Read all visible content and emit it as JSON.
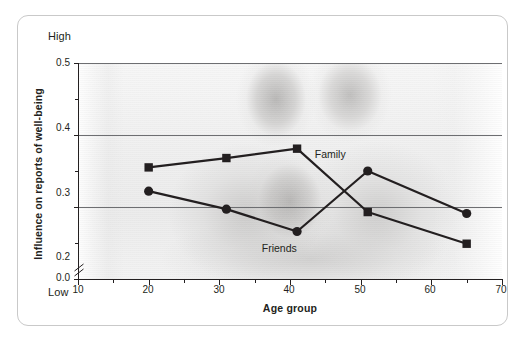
{
  "chart_data": {
    "type": "line",
    "title": "",
    "xlabel": "Age group",
    "ylabel": "Influence on reports of well-being",
    "xlim": [
      10,
      70
    ],
    "ylim": [
      0.2,
      0.5
    ],
    "y_axis_break": true,
    "y_break_labels": [
      "0.0",
      "0.2"
    ],
    "xticks": [
      10,
      20,
      30,
      40,
      50,
      60,
      70
    ],
    "xtick_labels": [
      "10",
      "20",
      "30",
      "40",
      "50",
      "60",
      "70"
    ],
    "yticks": [
      0.2,
      0.3,
      0.4,
      0.5
    ],
    "ytick_labels": [
      "0.2",
      "0.3",
      "0.4",
      "0.5"
    ],
    "y_minor_ticks": [
      0.25,
      0.35,
      0.45
    ],
    "grid": "horizontal",
    "axis_high_label": "High",
    "axis_low_label": "Low",
    "legend_position": "inline-annotations",
    "series": [
      {
        "name": "Family",
        "marker": "square",
        "color": "#231f20",
        "x": [
          20,
          31,
          41,
          51,
          65
        ],
        "values": [
          0.355,
          0.368,
          0.381,
          0.293,
          0.249
        ]
      },
      {
        "name": "Friends",
        "marker": "circle",
        "color": "#231f20",
        "x": [
          20,
          31,
          41,
          51,
          65
        ],
        "values": [
          0.322,
          0.297,
          0.266,
          0.35,
          0.291
        ]
      }
    ],
    "annotations": [
      {
        "text": "Family",
        "x": 43.5,
        "y": 0.372
      },
      {
        "text": "Friends",
        "x": 36.0,
        "y": 0.241
      }
    ]
  },
  "style": {
    "line_color": "#231f20",
    "grid_color": "#6d6e71",
    "frame_color": "#c9c9c9",
    "text_color": "#231f20",
    "background": "#ffffff"
  },
  "background_image": {
    "description": "faded grayscale photograph of a family: two smiling women and a child",
    "alt": "family-photo-watermark"
  }
}
